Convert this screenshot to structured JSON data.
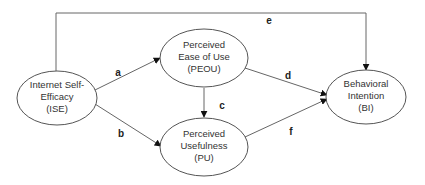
{
  "diagram": {
    "type": "path-model",
    "colors": {
      "stroke": "#555555",
      "text": "#333333",
      "background": "#ffffff"
    },
    "nodes": [
      {
        "id": "ISE",
        "lines": [
          "Internet Self-",
          "Efficacy",
          "(ISE)"
        ]
      },
      {
        "id": "PEOU",
        "lines": [
          "Perceived",
          "Ease of Use",
          "(PEOU)"
        ]
      },
      {
        "id": "PU",
        "lines": [
          "Perceived",
          "Usefulness",
          "(PU)"
        ]
      },
      {
        "id": "BI",
        "lines": [
          "Behavioral",
          "Intention",
          "(BI)"
        ]
      }
    ],
    "edges": [
      {
        "label": "a",
        "from": "ISE",
        "to": "PEOU"
      },
      {
        "label": "b",
        "from": "ISE",
        "to": "PU"
      },
      {
        "label": "c",
        "from": "PEOU",
        "to": "PU"
      },
      {
        "label": "d",
        "from": "PEOU",
        "to": "BI"
      },
      {
        "label": "e",
        "from": "ISE",
        "to": "BI"
      },
      {
        "label": "f",
        "from": "PU",
        "to": "BI"
      }
    ]
  }
}
